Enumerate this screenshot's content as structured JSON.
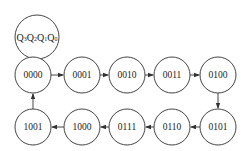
{
  "legend": {
    "label": "Q3Q2Q1Q0",
    "parts": [
      {
        "q": "Q",
        "sub": "3"
      },
      {
        "q": "Q",
        "sub": "2"
      },
      {
        "q": "Q",
        "sub": "1"
      },
      {
        "q": "Q",
        "sub": "0"
      }
    ]
  },
  "states": [
    {
      "id": "s0",
      "label": "0000",
      "cx": 33,
      "cy": 75
    },
    {
      "id": "s1",
      "label": "0001",
      "cx": 82,
      "cy": 75
    },
    {
      "id": "s2",
      "label": "0010",
      "cx": 127,
      "cy": 75
    },
    {
      "id": "s3",
      "label": "0011",
      "cx": 172,
      "cy": 75
    },
    {
      "id": "s4",
      "label": "0100",
      "cx": 218,
      "cy": 75
    },
    {
      "id": "s5",
      "label": "0101",
      "cx": 218,
      "cy": 127
    },
    {
      "id": "s6",
      "label": "0110",
      "cx": 172,
      "cy": 127
    },
    {
      "id": "s7",
      "label": "0111",
      "cx": 127,
      "cy": 127
    },
    {
      "id": "s8",
      "label": "1000",
      "cx": 82,
      "cy": 127
    },
    {
      "id": "s9",
      "label": "1001",
      "cx": 33,
      "cy": 127
    }
  ],
  "transitions": [
    [
      "0000",
      "0001"
    ],
    [
      "0001",
      "0010"
    ],
    [
      "0010",
      "0011"
    ],
    [
      "0011",
      "0100"
    ],
    [
      "0100",
      "0101"
    ],
    [
      "0101",
      "0110"
    ],
    [
      "0110",
      "0111"
    ],
    [
      "0111",
      "1000"
    ],
    [
      "1000",
      "1001"
    ],
    [
      "1001",
      "0000"
    ]
  ]
}
